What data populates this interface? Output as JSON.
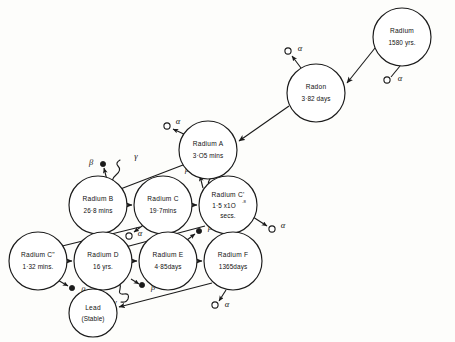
{
  "diagram": {
    "type": "decay-chain",
    "nodes": [
      {
        "id": "radium",
        "name": "Radium",
        "half_life": "1580 yrs.",
        "cx": 402,
        "cy": 37,
        "r": 29
      },
      {
        "id": "radon",
        "name": "Radon",
        "half_life": "3·82 days",
        "cx": 316,
        "cy": 93,
        "r": 29
      },
      {
        "id": "radium_a",
        "name": "Radium A",
        "half_life": "3·O5 mins",
        "cx": 208,
        "cy": 150,
        "r": 29
      },
      {
        "id": "radium_b",
        "name": "Radium B",
        "half_life": "26·8 mins",
        "cx": 98,
        "cy": 205,
        "r": 29
      },
      {
        "id": "radium_c",
        "name": "Radium C",
        "half_life": "19·7mins",
        "cx": 163,
        "cy": 205,
        "r": 29
      },
      {
        "id": "radium_cp",
        "name": "Radium C'",
        "half_life": "1·5 x1O",
        "half_life_sup": "-8",
        "half_life2": "secs.",
        "cx": 228,
        "cy": 205,
        "r": 29
      },
      {
        "id": "radium_cpp",
        "name": "Radium C\"",
        "half_life": "1·32 mins.",
        "cx": 38,
        "cy": 261,
        "r": 29
      },
      {
        "id": "radium_d",
        "name": "Radium D",
        "half_life": "16 yrs.",
        "cx": 103,
        "cy": 261,
        "r": 29
      },
      {
        "id": "radium_e",
        "name": "Radium E",
        "half_life": "4·85days",
        "cx": 168,
        "cy": 261,
        "r": 29
      },
      {
        "id": "radium_f",
        "name": "Radium F",
        "half_life": "1365days",
        "cx": 233,
        "cy": 261,
        "r": 29
      },
      {
        "id": "lead",
        "name": "Lead",
        "half_life": "(Stable)",
        "cx": 93,
        "cy": 313,
        "r": 24
      }
    ],
    "transitions": [
      {
        "from": "radium",
        "to": "radon",
        "particle": "alpha"
      },
      {
        "from": "radon",
        "to": "radium_a",
        "particle": "alpha"
      },
      {
        "from": "radium_a",
        "to": "radium_b",
        "particle": "alpha"
      },
      {
        "from": "radium_b",
        "to": "radium_c",
        "particle": "beta-gamma"
      },
      {
        "from": "radium_c",
        "to": "radium_cp",
        "particle": "beta-gamma"
      },
      {
        "from": "radium_c",
        "to": "radium_cpp",
        "particle": "alpha"
      },
      {
        "from": "radium_cp",
        "to": "radium_d",
        "particle": "alpha"
      },
      {
        "from": "radium_cpp",
        "to": "radium_d",
        "particle": "beta"
      },
      {
        "from": "radium_d",
        "to": "radium_e",
        "particle": "beta-gamma"
      },
      {
        "from": "radium_e",
        "to": "radium_f",
        "particle": "beta"
      },
      {
        "from": "radium_f",
        "to": "lead",
        "particle": "alpha"
      }
    ],
    "particle_labels": {
      "alpha": "α",
      "beta": "β",
      "gamma": "γ"
    },
    "emissions": [
      {
        "id": "em-ra-alpha",
        "particle": "alpha",
        "label": "α",
        "dot_x": 389,
        "dot_y": 80,
        "label_x": 400,
        "label_y": 78
      },
      {
        "id": "em-rn-alpha",
        "particle": "alpha",
        "label": "α",
        "dot_x": 289,
        "dot_y": 53,
        "label_x": 300,
        "label_y": 50
      },
      {
        "id": "em-raa-alpha",
        "particle": "alpha",
        "label": "α",
        "dot_x": 166,
        "dot_y": 128,
        "label_x": 177,
        "label_y": 124
      },
      {
        "id": "em-rab-beta",
        "particle": "beta",
        "label": "β",
        "dot_x": 103,
        "dot_y": 164,
        "label_x": 92,
        "label_y": 164
      },
      {
        "id": "em-rab-gamma",
        "particle": "gamma",
        "label": "γ",
        "label_x": 135,
        "label_y": 160
      },
      {
        "id": "em-rac-beta",
        "particle": "beta",
        "label": "β",
        "dot_x": 198,
        "dot_y": 172,
        "label_x": 187,
        "label_y": 170
      },
      {
        "id": "em-rac-gamma",
        "particle": "gamma",
        "label": "γ",
        "label_x": 229,
        "label_y": 164
      },
      {
        "id": "em-rac-alpha",
        "particle": "alpha",
        "label": "α",
        "dot_x": 128,
        "dot_y": 236,
        "label_x": 139,
        "label_y": 234
      },
      {
        "id": "em-racp-alpha",
        "particle": "alpha",
        "label": "α",
        "dot_x": 272,
        "dot_y": 229,
        "label_x": 283,
        "label_y": 226
      },
      {
        "id": "em-racpp-beta",
        "particle": "beta",
        "label": "β",
        "dot_x": 72,
        "dot_y": 288,
        "label_x": 83,
        "label_y": 291
      },
      {
        "id": "em-rad-gamma",
        "particle": "gamma",
        "label": "γ",
        "label_x": 123,
        "label_y": 297
      },
      {
        "id": "em-rae-beta",
        "particle": "beta",
        "label": "β",
        "dot_x": 142,
        "dot_y": 285,
        "label_x": 153,
        "label_y": 288
      },
      {
        "id": "em-rae-beta2",
        "particle": "beta",
        "label": "β",
        "dot_x": 199,
        "dot_y": 231,
        "label_x": 210,
        "label_y": 228
      },
      {
        "id": "em-raf-alpha",
        "particle": "alpha",
        "label": "α",
        "dot_x": 216,
        "dot_y": 305,
        "label_x": 227,
        "label_y": 305
      }
    ],
    "colors": {
      "ink": "#1a1a1a",
      "paper": "#fdfdfb",
      "node_fill": "#ffffff"
    }
  }
}
